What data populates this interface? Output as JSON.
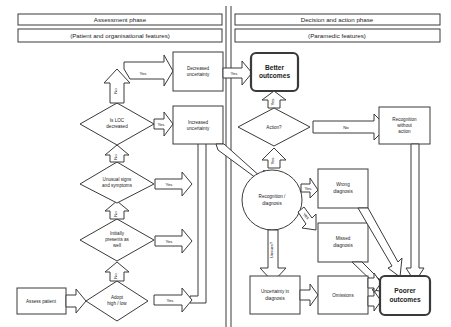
{
  "headers": {
    "assessment_phase": "Assessment phase",
    "assessment_sub": "(Patient and organisational features)",
    "decision_phase": "Decision and action phase",
    "decision_sub": "(Paramedic features)"
  },
  "nodes": {
    "assess_patient": "Assess patient",
    "adopt_1": "Adopt",
    "adopt_2": "high / low",
    "initially_1": "Initially",
    "initially_2": "presents as",
    "initially_3": "well",
    "unusual_1": "Unusual signs",
    "unusual_2": "and symptoms",
    "loc_1": "Is LOC",
    "loc_2": "decreased",
    "decreased_1": "Decreased",
    "decreased_2": "uncertainty",
    "increased_1": "Increased",
    "increased_2": "uncertainty",
    "better_1": "Better",
    "better_2": "outcomes",
    "action": "Action?",
    "recog_wo_1": "Recognition",
    "recog_wo_2": "without",
    "recog_wo_3": "action",
    "recog_diag_1": "Recognition /",
    "recog_diag_2": "diagnosis",
    "wrong_1": "Wrong",
    "wrong_2": "diagnosis",
    "missed_1": "Missed",
    "missed_2": "diagnosis",
    "uncert_diag_1": "Uncertainty in",
    "uncert_diag_2": "diagnosis",
    "omissions": "Omissions",
    "poorer_1": "Poorer",
    "poorer_2": "outcomes"
  },
  "edges": {
    "yes": "Yes",
    "no": "No",
    "unsure": "Unsure?"
  },
  "colors": {
    "stroke": "#3a3a3a",
    "fill": "#ffffff",
    "text": "#222222"
  }
}
